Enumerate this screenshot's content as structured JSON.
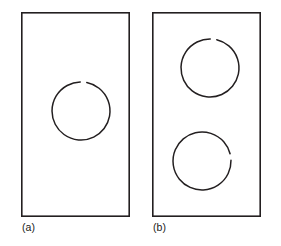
{
  "figure": {
    "type": "line-drawing-diagram",
    "background_color": "#ffffff",
    "stroke_color": "#231f20",
    "panel_stroke_width": 1.6,
    "ring_stroke_width": 1.5,
    "panels": [
      {
        "id": "a",
        "label": "(a)",
        "rings": [
          {
            "id": "ring-a",
            "name": "ring-with-gap-top",
            "gap_position": "top",
            "gap_center_degrees": 85,
            "gap_span_degrees": 13,
            "radius": 29
          }
        ]
      },
      {
        "id": "b",
        "label": "(b)",
        "rings": [
          {
            "id": "ring-b-upper",
            "name": "ring-with-gap-top",
            "gap_position": "top",
            "gap_center_degrees": 83,
            "gap_span_degrees": 13,
            "radius": 29
          },
          {
            "id": "ring-b-lower",
            "name": "ring-with-gap-right",
            "gap_position": "right",
            "gap_center_degrees": 8,
            "gap_span_degrees": 13,
            "radius": 29
          }
        ]
      }
    ]
  }
}
